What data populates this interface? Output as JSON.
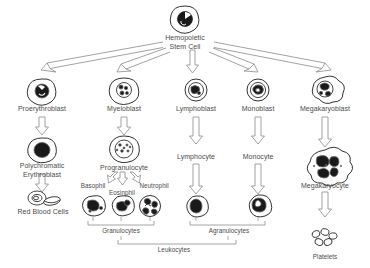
{
  "diagram": {
    "type": "flow-diagram",
    "ink_color": "#555555",
    "fill_color": "#1a1a1a",
    "text_color": "#4a4a4a",
    "background": "#ffffff"
  },
  "nodes": {
    "stem_cell": {
      "label": "Hemopoietic\nStem Cell",
      "x": 185,
      "y": 40
    },
    "proerythroblast": {
      "label": "Proerythroblast",
      "x": 42,
      "y": 104
    },
    "myeloblast": {
      "label": "Myeloblast",
      "x": 124,
      "y": 104
    },
    "lymphoblast": {
      "label": "Lymphoblast",
      "x": 196,
      "y": 104
    },
    "monoblast": {
      "label": "Monoblast",
      "x": 258,
      "y": 104
    },
    "megakaryoblast": {
      "label": "Megakaryoblast",
      "x": 325,
      "y": 104
    },
    "polychromatic_erythroblast": {
      "label": "Polychromatic\nErythroblast",
      "x": 42,
      "y": 163
    },
    "progranulocyte": {
      "label": "Progranulocyte",
      "x": 124,
      "y": 163
    },
    "lymphocyte": {
      "label": "Lymphocyte",
      "x": 196,
      "y": 157
    },
    "monocyte": {
      "label": "Monocyte",
      "x": 258,
      "y": 157
    },
    "megakaryocyte": {
      "label": "Megakaryocyte",
      "x": 325,
      "y": 180
    },
    "red_blood_cells": {
      "label": "Red Blood Cells",
      "x": 42,
      "y": 210
    },
    "basophil": {
      "label": "Basophil",
      "x": 93,
      "y": 186
    },
    "eosinphil": {
      "label": "Eosinphil",
      "x": 121,
      "y": 192
    },
    "neutrophil": {
      "label": "Neutrophil",
      "x": 152,
      "y": 186
    },
    "platelets": {
      "label": "Platelets",
      "x": 325,
      "y": 256
    }
  },
  "brackets": {
    "granulocytes": {
      "label": "Granulocytes",
      "x": 121,
      "y": 231
    },
    "agranulocytes": {
      "label": "Agranulocytes",
      "x": 228,
      "y": 231
    },
    "leukocytes": {
      "label": "Leukocytes",
      "x": 174,
      "y": 250
    }
  }
}
